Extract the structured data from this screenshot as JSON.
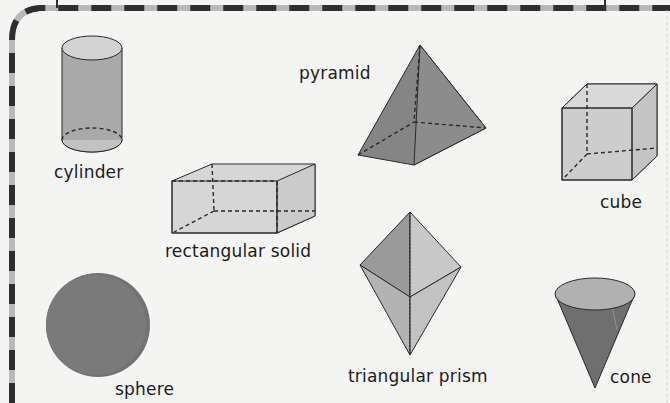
{
  "diagram": {
    "type": "geometric-solids-worksheet",
    "colors": {
      "background": "#f4f4f2",
      "border_dark": "#2e2e2e",
      "border_light": "#b8b8b8",
      "shape_light": "#d3d3d3",
      "shape_mid": "#a9a9a9",
      "shape_dark": "#7e7e7e",
      "outline": "#2a2a2a"
    },
    "shapes": [
      {
        "id": "cylinder",
        "label": "cylinder"
      },
      {
        "id": "pyramid",
        "label": "pyramid"
      },
      {
        "id": "cube",
        "label": "cube"
      },
      {
        "id": "rectangular-solid",
        "label": "rectangular solid"
      },
      {
        "id": "sphere",
        "label": "sphere"
      },
      {
        "id": "triangular-prism",
        "label": "triangular prism"
      },
      {
        "id": "cone",
        "label": "cone"
      }
    ]
  }
}
